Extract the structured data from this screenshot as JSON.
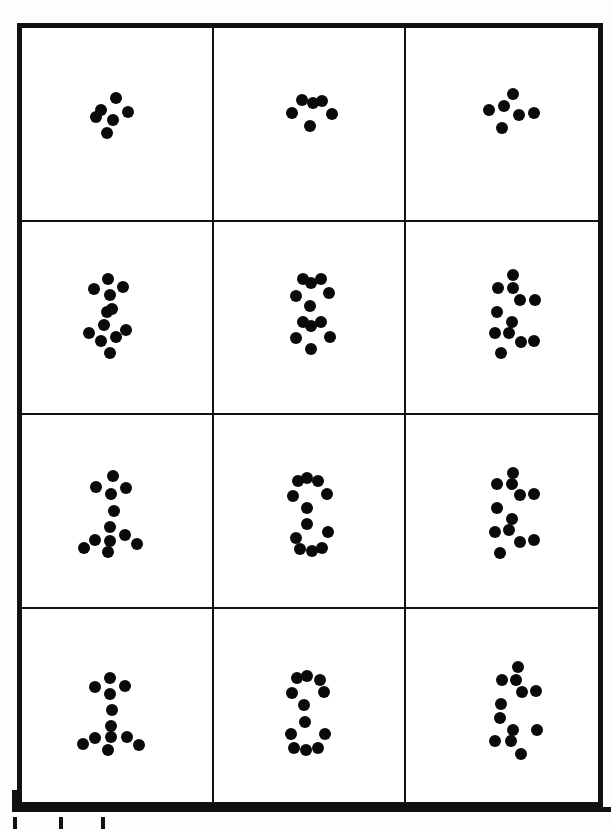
{
  "figure": {
    "kind": "dot-pattern-grid",
    "background_color": "#fdfdfd",
    "paper_color": "#ffffff",
    "ink_color": "#0a0a0a",
    "caption": "",
    "title": "",
    "rows": 4,
    "columns": 3,
    "dot_radius_px": 6,
    "frame": {
      "x": 17,
      "y": 23,
      "width": 586,
      "height": 784,
      "border_width": 5,
      "border_color": "#111111"
    }
  },
  "chart_data": {
    "type": "scatter",
    "title": "",
    "subtitle": "",
    "xlabel": "",
    "ylabel": "",
    "grid": true,
    "legend_position": "none",
    "panel_rows": 4,
    "panel_cols": 3,
    "dot_radius": 6,
    "panels": [
      {
        "id": "r1c1",
        "row": 1,
        "col": 1,
        "label": "",
        "dot_count": 6,
        "points": [
          [
            116,
            98
          ],
          [
            101,
            110
          ],
          [
            128,
            112
          ],
          [
            113,
            120
          ],
          [
            96,
            117
          ],
          [
            107,
            133
          ]
        ]
      },
      {
        "id": "r1c2",
        "row": 1,
        "col": 2,
        "label": "",
        "dot_count": 6,
        "points": [
          [
            302,
            100
          ],
          [
            313,
            103
          ],
          [
            322,
            101
          ],
          [
            292,
            113
          ],
          [
            332,
            114
          ],
          [
            310,
            126
          ]
        ]
      },
      {
        "id": "r1c3",
        "row": 1,
        "col": 3,
        "label": "",
        "dot_count": 6,
        "points": [
          [
            513,
            94
          ],
          [
            504,
            106
          ],
          [
            489,
            110
          ],
          [
            519,
            115
          ],
          [
            534,
            113
          ],
          [
            502,
            128
          ]
        ]
      },
      {
        "id": "r2c1",
        "row": 2,
        "col": 1,
        "label": "",
        "dot_count": 12,
        "points": [
          [
            108,
            279
          ],
          [
            123,
            287
          ],
          [
            94,
            289
          ],
          [
            110,
            295
          ],
          [
            107,
            312
          ],
          [
            104,
            325
          ],
          [
            89,
            333
          ],
          [
            101,
            341
          ],
          [
            116,
            337
          ],
          [
            126,
            330
          ],
          [
            110,
            353
          ],
          [
            112,
            309
          ]
        ]
      },
      {
        "id": "r2c2",
        "row": 2,
        "col": 2,
        "label": "",
        "dot_count": 12,
        "points": [
          [
            303,
            279
          ],
          [
            311,
            283
          ],
          [
            321,
            279
          ],
          [
            296,
            296
          ],
          [
            329,
            293
          ],
          [
            310,
            306
          ],
          [
            303,
            322
          ],
          [
            311,
            326
          ],
          [
            321,
            322
          ],
          [
            296,
            338
          ],
          [
            330,
            337
          ],
          [
            311,
            349
          ]
        ]
      },
      {
        "id": "r2c3",
        "row": 2,
        "col": 3,
        "label": "",
        "dot_count": 12,
        "points": [
          [
            513,
            275
          ],
          [
            498,
            288
          ],
          [
            513,
            288
          ],
          [
            520,
            300
          ],
          [
            535,
            300
          ],
          [
            497,
            312
          ],
          [
            512,
            322
          ],
          [
            495,
            333
          ],
          [
            509,
            333
          ],
          [
            521,
            342
          ],
          [
            534,
            341
          ],
          [
            501,
            353
          ]
        ]
      },
      {
        "id": "r3c1",
        "row": 3,
        "col": 1,
        "label": "",
        "dot_count": 12,
        "points": [
          [
            113,
            476
          ],
          [
            96,
            487
          ],
          [
            126,
            488
          ],
          [
            111,
            494
          ],
          [
            114,
            511
          ],
          [
            110,
            527
          ],
          [
            95,
            540
          ],
          [
            110,
            541
          ],
          [
            125,
            535
          ],
          [
            137,
            544
          ],
          [
            108,
            552
          ],
          [
            84,
            548
          ]
        ]
      },
      {
        "id": "r3c2",
        "row": 3,
        "col": 2,
        "label": "",
        "dot_count": 12,
        "points": [
          [
            298,
            481
          ],
          [
            307,
            478
          ],
          [
            318,
            481
          ],
          [
            293,
            496
          ],
          [
            327,
            494
          ],
          [
            307,
            508
          ],
          [
            307,
            524
          ],
          [
            296,
            538
          ],
          [
            328,
            532
          ],
          [
            300,
            549
          ],
          [
            312,
            551
          ],
          [
            322,
            548
          ]
        ]
      },
      {
        "id": "r3c3",
        "row": 3,
        "col": 3,
        "label": "",
        "dot_count": 12,
        "points": [
          [
            513,
            473
          ],
          [
            497,
            484
          ],
          [
            512,
            484
          ],
          [
            520,
            495
          ],
          [
            534,
            494
          ],
          [
            497,
            508
          ],
          [
            512,
            519
          ],
          [
            495,
            532
          ],
          [
            509,
            530
          ],
          [
            520,
            542
          ],
          [
            534,
            540
          ],
          [
            500,
            553
          ]
        ]
      },
      {
        "id": "r4c1",
        "row": 4,
        "col": 1,
        "label": "",
        "dot_count": 12,
        "points": [
          [
            110,
            678
          ],
          [
            95,
            687
          ],
          [
            125,
            686
          ],
          [
            110,
            694
          ],
          [
            112,
            710
          ],
          [
            111,
            726
          ],
          [
            95,
            738
          ],
          [
            111,
            737
          ],
          [
            127,
            737
          ],
          [
            139,
            745
          ],
          [
            108,
            750
          ],
          [
            83,
            744
          ]
        ]
      },
      {
        "id": "r4c2",
        "row": 4,
        "col": 2,
        "label": "",
        "dot_count": 12,
        "points": [
          [
            297,
            678
          ],
          [
            307,
            676
          ],
          [
            320,
            680
          ],
          [
            292,
            693
          ],
          [
            324,
            692
          ],
          [
            304,
            705
          ],
          [
            305,
            722
          ],
          [
            291,
            734
          ],
          [
            325,
            734
          ],
          [
            294,
            748
          ],
          [
            306,
            750
          ],
          [
            318,
            748
          ]
        ]
      },
      {
        "id": "r4c3",
        "row": 4,
        "col": 3,
        "label": "",
        "dot_count": 12,
        "points": [
          [
            518,
            667
          ],
          [
            502,
            680
          ],
          [
            516,
            680
          ],
          [
            522,
            692
          ],
          [
            536,
            691
          ],
          [
            501,
            704
          ],
          [
            500,
            718
          ],
          [
            513,
            730
          ],
          [
            537,
            730
          ],
          [
            495,
            741
          ],
          [
            511,
            741
          ],
          [
            521,
            754
          ]
        ]
      }
    ]
  },
  "scale_bar": {
    "name": "scale-bar",
    "label": "",
    "vertical_segment": {
      "x": 12,
      "y": 790,
      "width": 5,
      "height": 22
    },
    "horizontal_segment": {
      "x": 12,
      "y": 807,
      "width": 599,
      "height": 5
    },
    "ticks": [
      {
        "x": 13,
        "y": 817,
        "width": 4,
        "height": 12
      },
      {
        "x": 59,
        "y": 817,
        "width": 4,
        "height": 12
      },
      {
        "x": 101,
        "y": 817,
        "width": 4,
        "height": 12
      }
    ]
  }
}
